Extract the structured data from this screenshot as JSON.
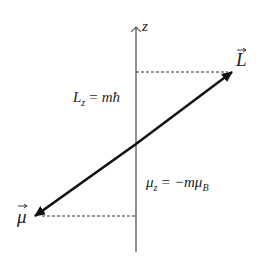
{
  "diagram": {
    "title": "",
    "axis": {
      "label": "z"
    },
    "vectors": {
      "angular_momentum": {
        "symbol": "L",
        "has_arrow_over": true
      },
      "magnetic_moment": {
        "symbol": "μ",
        "has_arrow_over": true
      }
    },
    "equations": {
      "lz": {
        "lhs": "L",
        "lhs_sub": "z",
        "eq": "=",
        "rhs": "mħ"
      },
      "muz": {
        "lhs": "μ",
        "lhs_sub": "z",
        "eq": "=",
        "rhs_pre": "−mμ",
        "rhs_sub": "B"
      }
    },
    "colors": {
      "axis": "#555555",
      "vector": "#111111",
      "dashed": "#333333",
      "text": "#222222"
    }
  }
}
